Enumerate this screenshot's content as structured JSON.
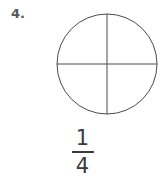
{
  "item": {
    "number_label": "4.",
    "shape_name": "circle",
    "total_parts": 4,
    "shaded_parts": 0,
    "divider_orientation": "vertical-and-horizontal"
  },
  "fraction": {
    "numerator": "1",
    "denominator": "4",
    "text": "1/4"
  },
  "colors": {
    "background": "#ffffff",
    "stroke": "#4a4a4c",
    "number_text": "#58585a",
    "fraction_text": "#3a3a3c"
  },
  "geometry": {
    "circle_center_x": 107,
    "circle_center_y": 64,
    "circle_radius": 50
  }
}
